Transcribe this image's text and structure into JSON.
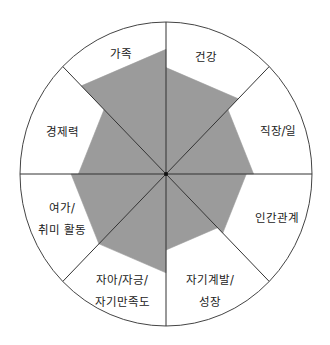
{
  "chart_data": {
    "type": "radar",
    "title": "",
    "style": "wheel-of-life (sector fill with flat chord)",
    "scale_max": 10,
    "categories": [
      "건강",
      "직장/일",
      "인간관계",
      "자기계발/성장",
      "자아/자긍/자기만족도",
      "여가/취미 활동",
      "경제력",
      "가족"
    ],
    "values": [
      7,
      6,
      5.5,
      5,
      6.5,
      6.5,
      6,
      8.2
    ],
    "label_lines": [
      [
        "건강"
      ],
      [
        "직장/일"
      ],
      [
        "인간관계"
      ],
      [
        "자기계발/",
        "성장"
      ],
      [
        "자아/자긍/",
        "자기만족도"
      ],
      [
        "여가/",
        "취미 활동"
      ],
      [
        "경제력"
      ],
      [
        "가족"
      ]
    ],
    "fill_color": "#9b9b9b",
    "line_color": "#333333",
    "grid": false,
    "legend": "none"
  }
}
